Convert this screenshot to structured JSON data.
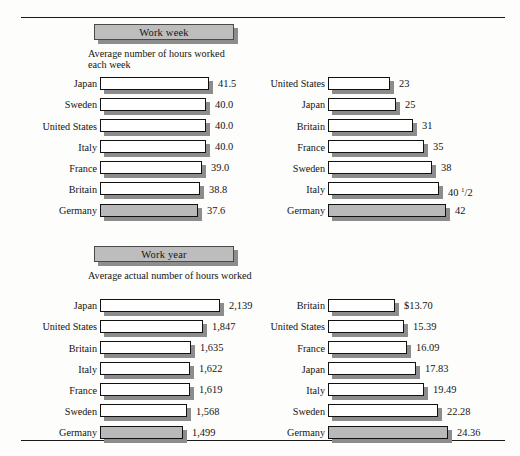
{
  "figure": {
    "rules": [
      "top-rule",
      "bottom-rule"
    ]
  },
  "chart_data": [
    {
      "type": "bar",
      "title": "Work week",
      "subtitle": "Average number of hours worked each week",
      "orientation": "horizontal",
      "categories": [
        "Japan",
        "Sweden",
        "United States",
        "Italy",
        "France",
        "Britain",
        "Germany"
      ],
      "values": [
        41.5,
        40.0,
        40.0,
        40.0,
        39.0,
        38.8,
        37.6
      ],
      "labels": [
        "41.5",
        "40.0",
        "40.0",
        "40.0",
        "39.0",
        "38.8",
        "37.6"
      ],
      "highlighted": "Germany",
      "xlabel": "",
      "ylabel": "",
      "grid": false,
      "legend": false
    },
    {
      "type": "bar",
      "title": "Days off",
      "subtitle": "Average number of paid holidays and vacation days",
      "orientation": "horizontal",
      "categories": [
        "United States",
        "Japan",
        "Britain",
        "France",
        "Sweden",
        "Italy",
        "Germany"
      ],
      "values": [
        23,
        25,
        31,
        35,
        38,
        40.5,
        42
      ],
      "labels": [
        "23",
        "25",
        "31",
        "35",
        "38",
        "40 1/2",
        "42"
      ],
      "highlighted": "Germany",
      "xlabel": "",
      "ylabel": "",
      "grid": false,
      "legend": false
    },
    {
      "type": "bar",
      "title": "Work year",
      "subtitle": "Average actual number of hours worked",
      "orientation": "horizontal",
      "categories": [
        "Japan",
        "United States",
        "Britain",
        "Italy",
        "France",
        "Sweden",
        "Germany"
      ],
      "values": [
        2139,
        1847,
        1635,
        1622,
        1619,
        1568,
        1499
      ],
      "labels": [
        "2,139",
        "1,847",
        "1,635",
        "1,622",
        "1,619",
        "1,568",
        "1,499"
      ],
      "highlighted": "Germany",
      "xlabel": "",
      "ylabel": "",
      "grid": false,
      "legend": false
    },
    {
      "type": "bar",
      "title": "Cost of labor",
      "subtitle": "Cost of each hour of manufacturing labor, including benefits",
      "orientation": "horizontal",
      "categories": [
        "Britain",
        "United States",
        "France",
        "Japan",
        "Italy",
        "Sweden",
        "Germany"
      ],
      "values": [
        13.7,
        15.39,
        16.09,
        17.83,
        19.49,
        22.28,
        24.36
      ],
      "labels": [
        "$13.70",
        "15.39",
        "16.09",
        "17.83",
        "19.49",
        "22.28",
        "24.36"
      ],
      "highlighted": "Germany",
      "xlabel": "",
      "ylabel": "",
      "grid": false,
      "legend": false
    }
  ],
  "colors": {
    "bar_fill": "#ffffff",
    "bar_highlight": "#b9b9b9",
    "shadow": "#8c8c8c",
    "banner_fill": "#bdbdbd",
    "banner_shadow": "#8d8d8d",
    "outline": "#111111",
    "text": "#141414"
  },
  "layout": {
    "panels": [
      {
        "cat_right": 97,
        "bar_left": 100,
        "bar_max": 112,
        "banner_left": 94,
        "banner_width": 140,
        "sub_left": 88,
        "sub_width": 150,
        "bar_px": [
          109,
          106,
          106,
          106,
          102,
          100,
          98
        ]
      },
      {
        "cat_right": 325,
        "bar_left": 328,
        "bar_max": 118,
        "banner_left": 348,
        "banner_width": 128,
        "sub_left": 328,
        "sub_width": 170,
        "bar_px": [
          62,
          68,
          85,
          96,
          104,
          111,
          118
        ]
      },
      {
        "cat_right": 97,
        "bar_left": 100,
        "bar_max": 120,
        "banner_left": 94,
        "banner_width": 140,
        "sub_left": 88,
        "sub_width": 165,
        "bar_px": [
          120,
          103,
          91,
          90,
          90,
          87,
          83
        ]
      },
      {
        "cat_right": 325,
        "bar_left": 328,
        "bar_max": 120,
        "banner_left": 348,
        "banner_width": 128,
        "sub_left": 328,
        "sub_width": 180,
        "bar_px": [
          67,
          76,
          79,
          88,
          96,
          110,
          120
        ]
      }
    ]
  }
}
